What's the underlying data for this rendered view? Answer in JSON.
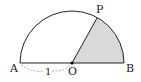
{
  "figure": {
    "type": "semicircle-sector",
    "points": {
      "A": {
        "label": "A"
      },
      "B": {
        "label": "B"
      },
      "O": {
        "label": "O"
      },
      "P": {
        "label": "P"
      }
    },
    "radius_label": "1",
    "shaded_region": "sector POB",
    "colors": {
      "stroke": "#222222",
      "shade": "#d9d9d9",
      "dashed": "#999999"
    }
  }
}
